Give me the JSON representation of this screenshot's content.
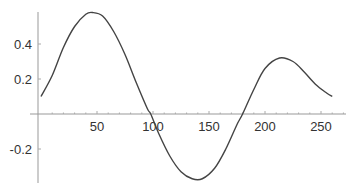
{
  "chart_data": {
    "type": "line",
    "title": "",
    "xlabel": "",
    "ylabel": "",
    "xlim": [
      0,
      260
    ],
    "ylim": [
      -0.38,
      0.6
    ],
    "grid": false,
    "legend": null,
    "x_ticks": [
      50,
      100,
      150,
      200,
      250
    ],
    "x_tick_labels": [
      "50",
      "100",
      "150",
      "200",
      "250"
    ],
    "y_ticks": [
      -0.2,
      0.2,
      0.4
    ],
    "y_tick_labels": [
      "-0.2",
      "0.2",
      "0.4"
    ],
    "series": [
      {
        "name": "curve",
        "color": "#444444",
        "x": [
          0,
          10,
          20,
          30,
          40,
          46,
          55,
          65,
          75,
          85,
          95,
          98,
          105,
          115,
          125,
          135,
          144,
          155,
          165,
          175,
          180,
          190,
          200,
          213,
          225,
          235,
          245,
          255,
          260
        ],
        "y": [
          0.1,
          0.22,
          0.38,
          0.5,
          0.57,
          0.58,
          0.56,
          0.47,
          0.34,
          0.18,
          0.03,
          0.0,
          -0.11,
          -0.24,
          -0.33,
          -0.37,
          -0.37,
          -0.31,
          -0.2,
          -0.06,
          0.0,
          0.14,
          0.26,
          0.32,
          0.3,
          0.24,
          0.17,
          0.12,
          0.1
        ]
      }
    ]
  }
}
